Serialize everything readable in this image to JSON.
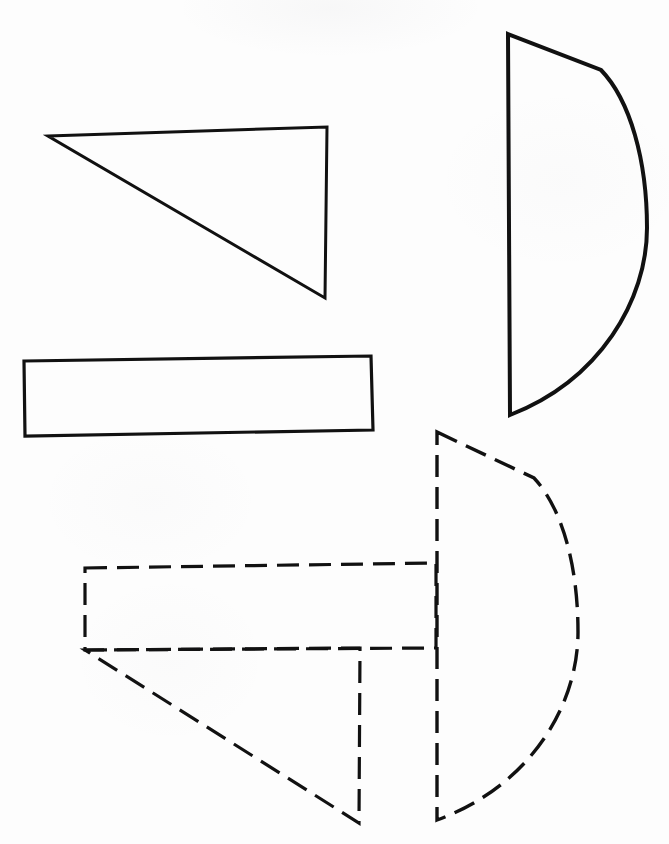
{
  "document": {
    "title": "Geometric Shapes Line Drawing",
    "canvas": {
      "width": 669,
      "height": 844
    },
    "background_color": "#fdfdfd",
    "ink_color": "#111111"
  },
  "style": {
    "solid_stroke_width": 3.0,
    "dashed_stroke_width": 3.2,
    "dash_length": 22,
    "dash_gap": 10
  },
  "figure_data": {
    "type": "line-drawing",
    "description": "Four outline shapes on a blank sheet: a solid right triangle, a solid elongated rectangle, a solid half-disc, and a dashed composite of a rectangle, triangle and half-disc.",
    "shapes": [
      {
        "id": "solid-triangle",
        "label": "Solid right triangle",
        "line_style": "solid",
        "closed": true,
        "points": [
          [
            48,
            136
          ],
          [
            327,
            127
          ],
          [
            325,
            298
          ]
        ]
      },
      {
        "id": "solid-rectangle",
        "label": "Solid elongated rectangle",
        "line_style": "solid",
        "closed": true,
        "points": [
          [
            24,
            361
          ],
          [
            371,
            356
          ],
          [
            373,
            430
          ],
          [
            25,
            436
          ]
        ]
      },
      {
        "id": "solid-half-disc",
        "label": "Solid half-disc with straight chord on left",
        "line_style": "solid",
        "closed": true,
        "chord": [
          [
            508,
            34
          ],
          [
            510,
            415
          ]
        ],
        "kink": [
          601,
          70
        ],
        "apex": [
          647,
          224
        ],
        "path": "M 508 34 L 601 70 C 630 100 647 160 647 228 C 647 300 600 380 510 415 Z"
      },
      {
        "id": "dashed-rectangle",
        "label": "Dashed rectangle",
        "line_style": "dashed",
        "closed": true,
        "points": [
          [
            85,
            568
          ],
          [
            436,
            563
          ],
          [
            436,
            648
          ],
          [
            85,
            650
          ]
        ]
      },
      {
        "id": "dashed-triangle",
        "label": "Dashed right triangle",
        "line_style": "dashed",
        "closed": true,
        "points": [
          [
            85,
            650
          ],
          [
            360,
            648
          ],
          [
            359,
            823
          ]
        ]
      },
      {
        "id": "dashed-half-disc",
        "label": "Dashed half-disc with straight chord on left",
        "line_style": "dashed",
        "closed": true,
        "chord": [
          [
            437,
            432
          ],
          [
            437,
            820
          ]
        ],
        "kink": [
          534,
          478
        ],
        "apex": [
          578,
          630
        ],
        "path": "M 437 432 L 534 478 C 562 508 578 565 578 632 C 578 706 530 786 437 820 Z"
      }
    ]
  }
}
